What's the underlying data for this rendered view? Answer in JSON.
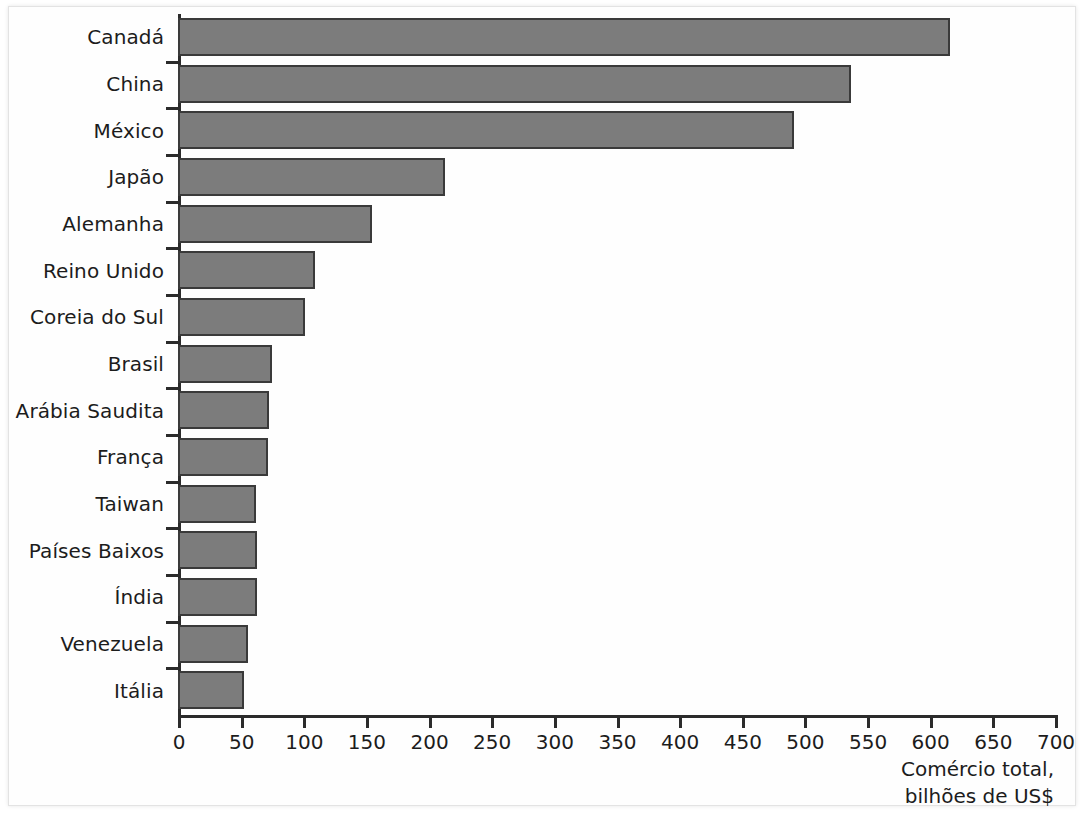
{
  "chart_data": {
    "type": "bar",
    "orientation": "horizontal",
    "title": "",
    "xlabel": "Comércio total, bilhões de US$",
    "xlabel_line1": "Comércio total,",
    "xlabel_line2": "bilhões de US$",
    "ylabel": "",
    "xlim": [
      0,
      700
    ],
    "xtick_step": 50,
    "grid": false,
    "legend": null,
    "bar_color": "#7c7c7c",
    "bar_border_color": "#3a3a3a",
    "axis_color": "#2b2b2b",
    "background": "#ffffff",
    "xticks": [
      0,
      50,
      100,
      150,
      200,
      250,
      300,
      350,
      400,
      450,
      500,
      550,
      600,
      650,
      700
    ],
    "xtick_labels": [
      "0",
      "50",
      "100",
      "150",
      "200",
      "250",
      "300",
      "350",
      "400",
      "450",
      "500",
      "550",
      "600",
      "650",
      "700"
    ],
    "categories": [
      "Canadá",
      "China",
      "México",
      "Japão",
      "Alemanha",
      "Reino Unido",
      "Coreia do Sul",
      "Brasil",
      "Arábia Saudita",
      "França",
      "Taiwan",
      "Países Baixos",
      "Índia",
      "Venezuela",
      "Itália"
    ],
    "values": [
      616,
      537,
      492,
      213,
      155,
      109,
      101,
      75,
      73,
      72,
      62,
      63,
      63,
      56,
      53
    ],
    "series": [
      {
        "name": "Comércio total",
        "values": [
          616,
          537,
          492,
          213,
          155,
          109,
          101,
          75,
          73,
          72,
          62,
          63,
          63,
          56,
          53
        ]
      }
    ],
    "points": [
      {
        "category": "Canadá",
        "value": 616
      },
      {
        "category": "China",
        "value": 537
      },
      {
        "category": "México",
        "value": 492
      },
      {
        "category": "Japão",
        "value": 213
      },
      {
        "category": "Alemanha",
        "value": 155
      },
      {
        "category": "Reino Unido",
        "value": 109
      },
      {
        "category": "Coreia do Sul",
        "value": 101
      },
      {
        "category": "Brasil",
        "value": 75
      },
      {
        "category": "Arábia Saudita",
        "value": 73
      },
      {
        "category": "França",
        "value": 72
      },
      {
        "category": "Taiwan",
        "value": 62
      },
      {
        "category": "Países Baixos",
        "value": 63
      },
      {
        "category": "Índia",
        "value": 63
      },
      {
        "category": "Venezuela",
        "value": 56
      },
      {
        "category": "Itália",
        "value": 53
      }
    ]
  }
}
